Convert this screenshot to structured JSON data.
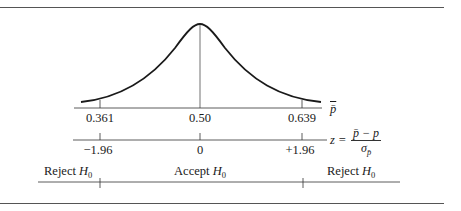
{
  "figure": {
    "type": "two-tailed hypothesis test sampling distribution",
    "pbar_axis": {
      "symbol": "p̄",
      "ticks": [
        "0.361",
        "0.50",
        "0.639"
      ]
    },
    "z_axis": {
      "ticks": [
        "−1.96",
        "0",
        "+1.96"
      ],
      "formula": {
        "lhs": "z =",
        "numerator": "p̄ − p",
        "denominator_base": "σ",
        "denominator_sub": "p̄"
      }
    },
    "regions": {
      "left": {
        "text": "Reject ",
        "var": "H",
        "sub": "0"
      },
      "center": {
        "text": "Accept ",
        "var": "H",
        "sub": "0"
      },
      "right": {
        "text": "Reject ",
        "var": "H",
        "sub": "0"
      }
    },
    "colors": {
      "line": "#1a1a1a",
      "rule": "#555555"
    }
  }
}
